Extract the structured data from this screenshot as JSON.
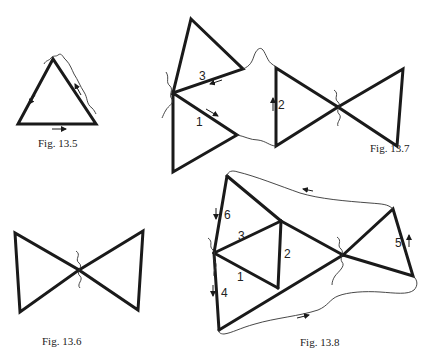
{
  "figures": {
    "fig_13_5": {
      "caption": "Fig. 13.5",
      "shape": "triangle",
      "vertices": [
        [
          53,
          59
        ],
        [
          18,
          124
        ],
        [
          96,
          124
        ]
      ]
    },
    "fig_13_6": {
      "caption": "Fig. 13.6",
      "shape": "bowtie",
      "center": [
        79,
        270
      ]
    },
    "fig_13_7": {
      "caption": "Fig. 13.7",
      "edge_labels": [
        "1",
        "2",
        "3"
      ]
    },
    "fig_13_8": {
      "caption": "Fig. 13.8",
      "edge_labels": [
        "1",
        "2",
        "3",
        "4",
        "5",
        "6"
      ]
    }
  },
  "colors": {
    "stroke": "#1a1a1a",
    "background": "#ffffff"
  }
}
